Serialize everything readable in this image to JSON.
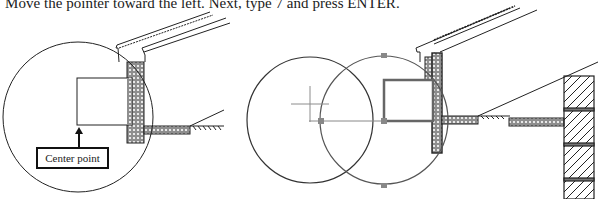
{
  "caption": "Move the pointer toward the left. Next, type 7 and press ENTER.",
  "left_figure": {
    "callout_label": "Center point",
    "circle": {
      "cx": 78,
      "cy": 117,
      "r": 75
    },
    "rectangle": {
      "x": 77,
      "y": 78,
      "w": 55,
      "h": 47
    }
  },
  "right_figure": {
    "circle_left": {
      "cx": 310,
      "cy": 120,
      "r": 63
    },
    "circle_right": {
      "cx": 384,
      "cy": 120,
      "r": 64
    },
    "rectangle": {
      "x": 384,
      "y": 80,
      "w": 49,
      "h": 41
    }
  },
  "colors": {
    "line": "#222222",
    "grip": "#8a8a8a",
    "hatch_fill": "#9a9a9a",
    "crosshair": "#8c8c8c"
  }
}
